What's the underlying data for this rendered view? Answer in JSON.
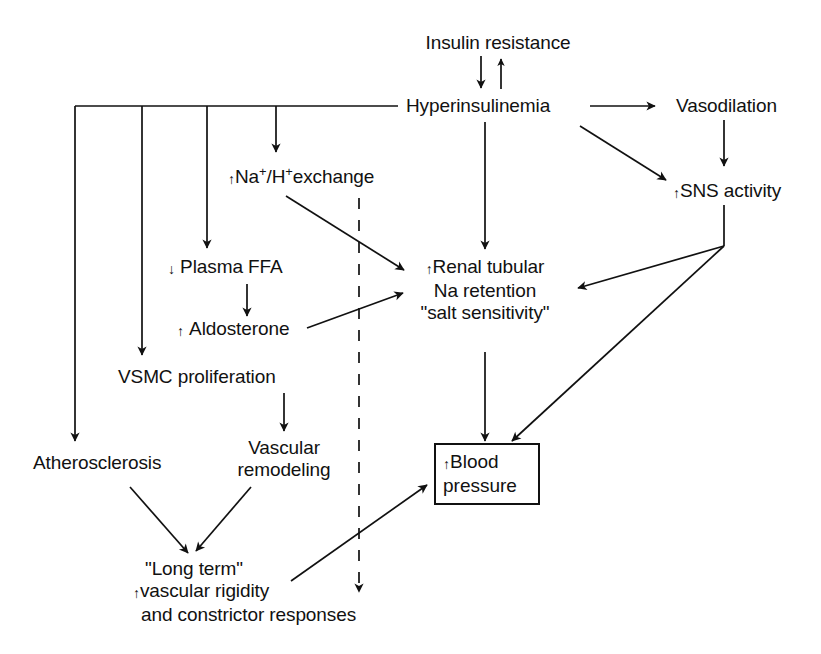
{
  "figure": {
    "type": "flowchart",
    "background_color": "#ffffff",
    "line_color": "#111111",
    "text_color": "#111111"
  },
  "nodes": {
    "insulin_resistance": {
      "label": "Insulin resistance"
    },
    "hyperinsulinemia": {
      "label": "Hyperinsulinemia"
    },
    "vasodilation": {
      "label": "Vasodilation"
    },
    "sns_activity": {
      "arrow": "↑",
      "label": "SNS activity"
    },
    "na_h_exchange": {
      "arrow": "↑",
      "label_part1": "Na",
      "sup1": "+",
      "slash": "/",
      "label_part2": "H",
      "sup2": "+",
      "label_part3": "exchange"
    },
    "plasma_ffa": {
      "arrow": "↓",
      "label": "Plasma FFA"
    },
    "aldosterone": {
      "arrow": "↑",
      "label": "Aldosterone"
    },
    "renal_tubular": {
      "arrow": "↑",
      "line1": "Renal tubular",
      "line2": "Na retention",
      "line3": "\"salt sensitivity\""
    },
    "vsmc_proliferation": {
      "label": "VSMC proliferation"
    },
    "vascular_remodeling": {
      "line1": "Vascular",
      "line2": "remodeling"
    },
    "atherosclerosis": {
      "label": "Atherosclerosis"
    },
    "long_term": {
      "line1": "\"Long term\"",
      "arrow": "↑",
      "line2": "vascular rigidity",
      "line3": "and constrictor responses"
    },
    "blood_pressure": {
      "arrow": "↑",
      "line1": "Blood",
      "line2": "pressure"
    }
  },
  "edges": [
    {
      "id": "insulin-to-hyper",
      "from": "insulin_resistance",
      "to": "hyperinsulinemia",
      "style": "solid"
    },
    {
      "id": "hyper-to-insulin",
      "from": "hyperinsulinemia",
      "to": "insulin_resistance",
      "style": "solid"
    },
    {
      "id": "hyper-to-vasodilation",
      "from": "hyperinsulinemia",
      "to": "vasodilation",
      "style": "solid"
    },
    {
      "id": "hyper-to-sns",
      "from": "hyperinsulinemia",
      "to": "sns_activity",
      "style": "solid"
    },
    {
      "id": "vasodilation-to-sns",
      "from": "vasodilation",
      "to": "sns_activity",
      "style": "solid"
    },
    {
      "id": "hyper-to-na-h-exchange",
      "from": "hyperinsulinemia",
      "to": "na_h_exchange",
      "style": "solid"
    },
    {
      "id": "hyper-to-plasma-ffa",
      "from": "hyperinsulinemia",
      "to": "plasma_ffa",
      "style": "solid"
    },
    {
      "id": "hyper-to-vsmc",
      "from": "hyperinsulinemia",
      "to": "vsmc_proliferation",
      "style": "solid"
    },
    {
      "id": "hyper-to-atherosclerosis",
      "from": "hyperinsulinemia",
      "to": "atherosclerosis",
      "style": "solid"
    },
    {
      "id": "hyper-to-renal",
      "from": "hyperinsulinemia",
      "to": "renal_tubular",
      "style": "solid"
    },
    {
      "id": "na-h-to-renal",
      "from": "na_h_exchange",
      "to": "renal_tubular",
      "style": "solid"
    },
    {
      "id": "plasma-ffa-to-aldosterone",
      "from": "plasma_ffa",
      "to": "aldosterone",
      "style": "solid"
    },
    {
      "id": "aldosterone-to-renal",
      "from": "aldosterone",
      "to": "renal_tubular",
      "style": "solid"
    },
    {
      "id": "sns-to-renal",
      "from": "sns_activity",
      "to": "renal_tubular",
      "style": "solid"
    },
    {
      "id": "sns-to-blood-pressure",
      "from": "sns_activity",
      "to": "blood_pressure",
      "style": "solid"
    },
    {
      "id": "renal-to-blood-pressure",
      "from": "renal_tubular",
      "to": "blood_pressure",
      "style": "solid"
    },
    {
      "id": "vsmc-to-vascular-remodeling",
      "from": "vsmc_proliferation",
      "to": "vascular_remodeling",
      "style": "solid"
    },
    {
      "id": "atherosclerosis-to-long-term",
      "from": "atherosclerosis",
      "to": "long_term",
      "style": "solid"
    },
    {
      "id": "vascular-remodeling-to-long-term",
      "from": "vascular_remodeling",
      "to": "long_term",
      "style": "solid"
    },
    {
      "id": "long-term-to-blood-pressure",
      "from": "long_term",
      "to": "blood_pressure",
      "style": "solid"
    },
    {
      "id": "na-h-dashed-downward",
      "from": "na_h_exchange",
      "to": "",
      "style": "dashed"
    }
  ]
}
